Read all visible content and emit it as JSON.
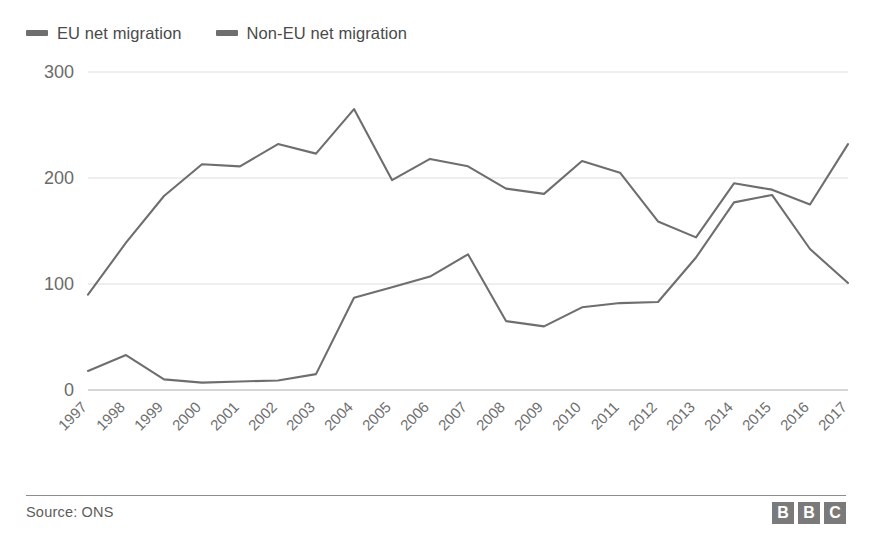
{
  "legend": {
    "position": "top-left",
    "items": [
      {
        "label": "EU net migration",
        "color": "#6e6e6e",
        "swatch": "line-swatch-eu"
      },
      {
        "label": "Non-EU net migration",
        "color": "#6e6e6e",
        "swatch": "line-swatch-noneu"
      }
    ]
  },
  "footer": {
    "source": "Source: ONS",
    "logo_letters": [
      "B",
      "B",
      "C"
    ]
  },
  "colors": {
    "eu_line": "#6e6e6e",
    "noneu_line": "#6e6e6e",
    "gridline": "#dedede",
    "axis_baseline": "#c9c9c9",
    "tick_text": "#6b6b6b",
    "legend_text": "#4a4a4a",
    "footer_rule": "#8d8d8d",
    "logo_block": "#7a7a7a"
  },
  "chart_data": {
    "type": "line",
    "title": "",
    "subtitle": "",
    "xlabel": "",
    "ylabel": "",
    "units": "thousands",
    "grid": true,
    "legend_position": "top-left",
    "xlim": [
      1997,
      2017
    ],
    "ylim": [
      0,
      300
    ],
    "yticks": [
      0,
      100,
      200,
      300
    ],
    "ytick_labels": [
      "0",
      "100",
      "200",
      "300"
    ],
    "categories": [
      "1997",
      "1998",
      "1999",
      "2000",
      "2001",
      "2002",
      "2003",
      "2004",
      "2005",
      "2006",
      "2007",
      "2008",
      "2009",
      "2010",
      "2011",
      "2012",
      "2013",
      "2014",
      "2015",
      "2016",
      "2017"
    ],
    "series": [
      {
        "name": "EU net migration",
        "color": "#6e6e6e",
        "values": [
          18,
          33,
          10,
          7,
          8,
          9,
          15,
          87,
          97,
          107,
          128,
          65,
          60,
          78,
          82,
          83,
          125,
          177,
          184,
          133,
          101
        ]
      },
      {
        "name": "Non-EU net migration",
        "color": "#6e6e6e",
        "values": [
          90,
          139,
          183,
          213,
          211,
          232,
          223,
          265,
          198,
          218,
          211,
          190,
          185,
          216,
          205,
          159,
          144,
          195,
          189,
          175,
          232
        ]
      }
    ]
  }
}
